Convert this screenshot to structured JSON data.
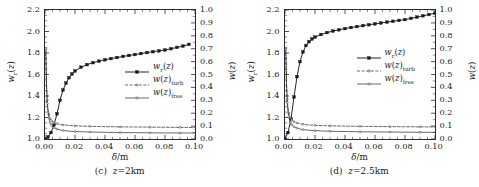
{
  "figure": {
    "style": "grayscale-scientific-line-plot",
    "panel_count": 2
  },
  "axes": {
    "x_label": "δ/m",
    "y_left_label": "wᵣ(z)",
    "y_right_label": "w(z)",
    "x_ticks": [
      "0.00",
      "0.02",
      "0.04",
      "0.06",
      "0.08",
      "0.10"
    ],
    "y_left_ticks": [
      "1.0",
      "1.2",
      "1.4",
      "1.6",
      "1.8",
      "2.0",
      "2.2"
    ],
    "y_right_ticks": [
      "0.0",
      "0.1",
      "0.2",
      "0.3",
      "0.4",
      "0.5",
      "0.6",
      "0.7",
      "0.8",
      "0.9",
      "1.0"
    ]
  },
  "legend": {
    "entries": [
      {
        "label_main": "w",
        "label_sub": "r",
        "label_arg": "(z)",
        "style": "solid-filled-square-marker"
      },
      {
        "label_main": "w",
        "label_sub": "turb",
        "label_arg": "(z)",
        "style": "dashed-open-marker"
      },
      {
        "label_main": "w",
        "label_sub": "free",
        "label_arg": "(z)",
        "style": "thin-solid-open-marker"
      }
    ]
  },
  "colors": {
    "line": "#1a1a1a",
    "axis": "#2b2b2b",
    "background": "#ffffff"
  },
  "chart_data": [
    {
      "type": "line",
      "title": "(c)  z=2km",
      "caption_prefix": "(c)",
      "caption_value": "z=2km",
      "xlabel": "δ/m",
      "ylabel": "wᵣ(z)",
      "ylabel_right": "w(z)",
      "xlim": [
        0.0,
        0.1
      ],
      "ylim": [
        1.0,
        2.2
      ],
      "ylim_right": [
        0.0,
        1.0
      ],
      "grid": false,
      "legend_position": "center-right",
      "series": [
        {
          "name": "w_r(z)",
          "axis": "left",
          "marker": "filled-square",
          "linestyle": "solid",
          "x": [
            0.0,
            0.002,
            0.004,
            0.006,
            0.008,
            0.01,
            0.012,
            0.014,
            0.016,
            0.018,
            0.02,
            0.024,
            0.028,
            0.032,
            0.036,
            0.04,
            0.044,
            0.048,
            0.052,
            0.056,
            0.06,
            0.064,
            0.068,
            0.072,
            0.076,
            0.08,
            0.084,
            0.088,
            0.092,
            0.096
          ],
          "y": [
            1.0,
            1.02,
            1.06,
            1.13,
            1.235,
            1.36,
            1.455,
            1.52,
            1.57,
            1.605,
            1.632,
            1.668,
            1.692,
            1.71,
            1.724,
            1.737,
            1.748,
            1.758,
            1.768,
            1.777,
            1.786,
            1.795,
            1.804,
            1.812,
            1.82,
            1.828,
            1.84,
            1.852,
            1.864,
            1.88
          ]
        },
        {
          "name": "w(z)_turb",
          "axis": "right",
          "marker": "open-small",
          "linestyle": "dashed",
          "x": [
            0.0005,
            0.001,
            0.0015,
            0.002,
            0.0025,
            0.003,
            0.0035,
            0.004,
            0.0045,
            0.005,
            0.006,
            0.007,
            0.008,
            0.01,
            0.012,
            0.015,
            0.02,
            0.025,
            0.03,
            0.04,
            0.05,
            0.06,
            0.07,
            0.08,
            0.09,
            0.1
          ],
          "y": [
            0.7,
            0.43,
            0.3,
            0.232,
            0.195,
            0.172,
            0.158,
            0.148,
            0.141,
            0.136,
            0.128,
            0.123,
            0.119,
            0.113,
            0.109,
            0.106,
            0.102,
            0.1,
            0.098,
            0.096,
            0.094,
            0.093,
            0.092,
            0.091,
            0.09,
            0.089
          ]
        },
        {
          "name": "w(z)_free",
          "axis": "right",
          "marker": "open-small",
          "linestyle": "solid-thin",
          "x": [
            0.0005,
            0.001,
            0.0015,
            0.002,
            0.0025,
            0.003,
            0.0035,
            0.004,
            0.0045,
            0.005,
            0.006,
            0.007,
            0.008,
            0.01,
            0.012,
            0.015,
            0.02,
            0.025,
            0.03,
            0.04,
            0.05,
            0.06,
            0.07,
            0.08,
            0.09,
            0.1
          ],
          "y": [
            0.69,
            0.41,
            0.275,
            0.205,
            0.165,
            0.14,
            0.124,
            0.112,
            0.104,
            0.097,
            0.088,
            0.082,
            0.077,
            0.07,
            0.066,
            0.062,
            0.058,
            0.056,
            0.054,
            0.052,
            0.05,
            0.049,
            0.048,
            0.047,
            0.047,
            0.046
          ]
        }
      ]
    },
    {
      "type": "line",
      "title": "(d)  z=2.5km",
      "caption_prefix": "(d)",
      "caption_value": "z=2.5km",
      "xlabel": "δ/m",
      "ylabel": "wᵣ(z)",
      "ylabel_right": "w(z)",
      "xlim": [
        0.0,
        0.1
      ],
      "ylim": [
        1.0,
        2.2
      ],
      "ylim_right": [
        0.0,
        1.0
      ],
      "grid": false,
      "legend_position": "center-right",
      "series": [
        {
          "name": "w_r(z)",
          "axis": "left",
          "marker": "filled-square",
          "linestyle": "solid",
          "x": [
            0.0,
            0.002,
            0.004,
            0.006,
            0.008,
            0.01,
            0.012,
            0.014,
            0.016,
            0.018,
            0.02,
            0.024,
            0.028,
            0.032,
            0.036,
            0.04,
            0.044,
            0.048,
            0.052,
            0.056,
            0.06,
            0.064,
            0.068,
            0.072,
            0.076,
            0.08,
            0.084,
            0.088,
            0.092,
            0.096,
            0.1
          ],
          "y": [
            1.0,
            1.06,
            1.19,
            1.39,
            1.58,
            1.72,
            1.81,
            1.87,
            1.905,
            1.93,
            1.948,
            1.972,
            1.99,
            2.004,
            2.016,
            2.027,
            2.037,
            2.046,
            2.055,
            2.063,
            2.071,
            2.079,
            2.087,
            2.095,
            2.103,
            2.111,
            2.122,
            2.134,
            2.146,
            2.158,
            2.17
          ]
        },
        {
          "name": "w(z)_turb",
          "axis": "right",
          "marker": "open-small",
          "linestyle": "dashed",
          "x": [
            0.0005,
            0.001,
            0.0015,
            0.002,
            0.0025,
            0.003,
            0.0035,
            0.004,
            0.0045,
            0.005,
            0.006,
            0.007,
            0.008,
            0.01,
            0.012,
            0.015,
            0.02,
            0.025,
            0.03,
            0.04,
            0.05,
            0.06,
            0.07,
            0.08,
            0.09,
            0.1
          ],
          "y": [
            0.705,
            0.437,
            0.307,
            0.239,
            0.202,
            0.179,
            0.164,
            0.154,
            0.147,
            0.142,
            0.134,
            0.128,
            0.124,
            0.118,
            0.114,
            0.11,
            0.106,
            0.104,
            0.102,
            0.1,
            0.098,
            0.097,
            0.096,
            0.095,
            0.094,
            0.093
          ]
        },
        {
          "name": "w(z)_free",
          "axis": "right",
          "marker": "open-small",
          "linestyle": "solid-thin",
          "x": [
            0.0005,
            0.001,
            0.0015,
            0.002,
            0.0025,
            0.003,
            0.0035,
            0.004,
            0.0045,
            0.005,
            0.006,
            0.007,
            0.008,
            0.01,
            0.012,
            0.015,
            0.02,
            0.025,
            0.03,
            0.04,
            0.05,
            0.06,
            0.07,
            0.08,
            0.09,
            0.1
          ],
          "y": [
            0.695,
            0.418,
            0.283,
            0.213,
            0.173,
            0.148,
            0.131,
            0.119,
            0.111,
            0.104,
            0.095,
            0.089,
            0.084,
            0.077,
            0.073,
            0.069,
            0.065,
            0.062,
            0.06,
            0.058,
            0.056,
            0.055,
            0.054,
            0.053,
            0.052,
            0.052
          ]
        }
      ]
    }
  ]
}
